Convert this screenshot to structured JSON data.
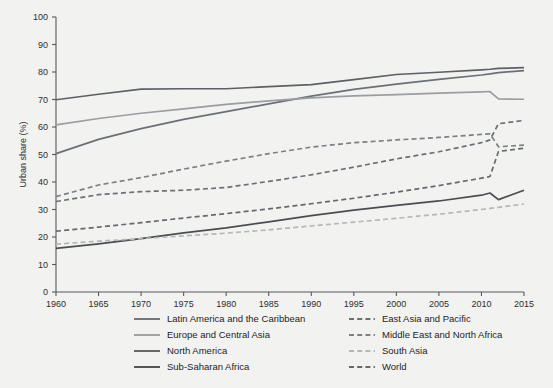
{
  "chart_data": {
    "type": "line",
    "title": "",
    "xlabel": "",
    "ylabel": "Urban share (%)",
    "xlim": [
      1960,
      2015
    ],
    "ylim": [
      0,
      100
    ],
    "grid": false,
    "legend_position": "below-plot",
    "x_ticks": [
      1960,
      1965,
      1970,
      1975,
      1980,
      1985,
      1990,
      1995,
      2000,
      2005,
      2010,
      2015
    ],
    "y_ticks": [
      0,
      10,
      20,
      30,
      40,
      50,
      60,
      70,
      80,
      90,
      100
    ],
    "x": [
      1960,
      1965,
      1970,
      1975,
      1980,
      1985,
      1990,
      1995,
      2000,
      2005,
      2010,
      2011,
      2012,
      2015
    ],
    "series": [
      {
        "name": "Latin America and the Caribbean",
        "style": "solid",
        "color": "#6b7078",
        "values": [
          50.3,
          55.5,
          59.4,
          62.8,
          65.6,
          68.4,
          71.2,
          73.7,
          75.6,
          77.3,
          78.9,
          79.3,
          79.8,
          80.5
        ]
      },
      {
        "name": "Europe and Central Asia",
        "style": "solid",
        "color": "#9a9ea2",
        "values": [
          60.8,
          63.1,
          65.0,
          66.6,
          68.2,
          69.5,
          70.6,
          71.3,
          71.8,
          72.3,
          72.8,
          72.9,
          70.2,
          70.1
        ]
      },
      {
        "name": "North America",
        "style": "solid",
        "color": "#5c6166",
        "values": [
          69.9,
          71.9,
          73.8,
          73.9,
          73.9,
          74.7,
          75.4,
          77.2,
          79.1,
          79.9,
          80.8,
          81.0,
          81.3,
          81.6
        ]
      },
      {
        "name": "Sub-Saharan Africa",
        "style": "solid",
        "color": "#4a4d52",
        "values": [
          15.9,
          17.5,
          19.4,
          21.5,
          23.3,
          25.5,
          27.8,
          29.8,
          31.5,
          33.1,
          35.2,
          36.0,
          33.6,
          37.0
        ]
      },
      {
        "name": "East Asia and Pacific",
        "style": "dashed",
        "color": "#6b7078",
        "values": [
          32.9,
          35.4,
          36.5,
          37.0,
          38.0,
          40.2,
          42.6,
          45.4,
          48.4,
          51.0,
          54.3,
          55.3,
          61.2,
          62.4
        ]
      },
      {
        "name": "Middle East and North Africa",
        "style": "dashed",
        "color": "#7c8187",
        "values": [
          34.7,
          38.9,
          41.6,
          44.7,
          47.6,
          50.3,
          52.7,
          54.3,
          55.3,
          56.2,
          57.3,
          57.5,
          52.8,
          53.4
        ]
      },
      {
        "name": "South Asia",
        "style": "dashed",
        "color": "#b4b8bb",
        "values": [
          17.4,
          18.5,
          19.4,
          20.4,
          21.4,
          22.6,
          24.0,
          25.4,
          26.8,
          28.3,
          30.0,
          30.4,
          30.8,
          32.0
        ]
      },
      {
        "name": "World",
        "style": "dashed",
        "color": "#646a70",
        "values": [
          22.1,
          23.6,
          25.2,
          26.9,
          28.5,
          30.2,
          32.1,
          34.1,
          36.3,
          38.7,
          41.4,
          42.0,
          51.1,
          52.3
        ]
      }
    ]
  },
  "axes": {
    "y_axis_title": "Urban share (%)",
    "y_tick_labels": [
      "0",
      "10",
      "20",
      "30",
      "40",
      "50",
      "60",
      "70",
      "80",
      "90",
      "100"
    ],
    "x_tick_labels": [
      "1960",
      "1965",
      "1970",
      "1975",
      "1980",
      "1985",
      "1990",
      "1995",
      "2000",
      "2005",
      "2010",
      "2015"
    ]
  },
  "legend": {
    "left_column": [
      {
        "label": "Latin America and the Caribbean",
        "style": "solid",
        "color": "#6b7078"
      },
      {
        "label": "Europe and Central Asia",
        "style": "solid",
        "color": "#9a9ea2"
      },
      {
        "label": "North America",
        "style": "solid",
        "color": "#5c6166"
      },
      {
        "label": "Sub-Saharan Africa",
        "style": "solid",
        "color": "#4a4d52"
      }
    ],
    "right_column": [
      {
        "label": "East Asia and Pacific",
        "style": "dashed",
        "color": "#6b7078"
      },
      {
        "label": "Middle East and North Africa",
        "style": "dashed",
        "color": "#7c8187"
      },
      {
        "label": "South Asia",
        "style": "dashed",
        "color": "#b4b8bb"
      },
      {
        "label": "World",
        "style": "dashed",
        "color": "#646a70"
      }
    ]
  }
}
